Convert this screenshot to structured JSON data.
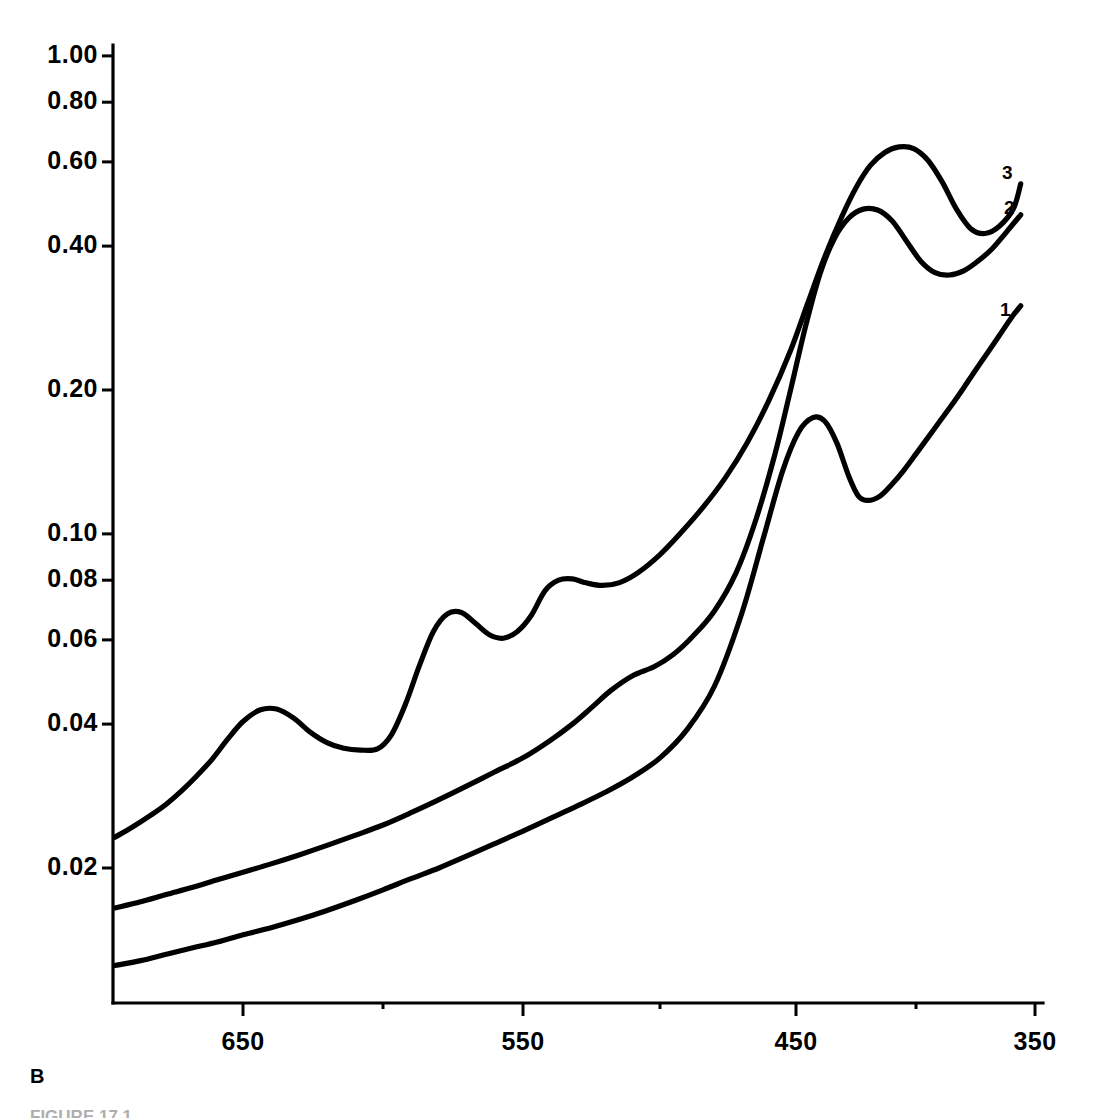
{
  "panel": {
    "label": "B",
    "caption_partial": "FIGURE 17.1"
  },
  "chart_data": {
    "type": "line",
    "title": "",
    "subtitle": "",
    "xlabel": "",
    "ylabel": "",
    "xlim": [
      700,
      350
    ],
    "ylim": [
      0.009,
      1.0
    ],
    "yscale": "log",
    "xscale": "linear",
    "x_reversed": true,
    "grid": false,
    "legend_position": "inline-right-end",
    "xticks": [
      650,
      550,
      450,
      350
    ],
    "xtick_labels": [
      "650",
      "550",
      "450",
      "350"
    ],
    "xminorticks": [
      600,
      500,
      400
    ],
    "yticks": [
      1.0,
      0.8,
      0.6,
      0.4,
      0.2,
      0.1,
      0.08,
      0.06,
      0.04,
      0.02
    ],
    "ytick_labels": [
      "1.00",
      "0.80",
      "0.60",
      "0.40",
      "0.20",
      "0.10",
      "0.08",
      "0.06",
      "0.04",
      "0.02"
    ],
    "series": [
      {
        "name": "1",
        "label": "1",
        "color": "#000000",
        "x": [
          700,
          690,
          680,
          670,
          660,
          650,
          640,
          630,
          620,
          610,
          600,
          590,
          580,
          570,
          560,
          550,
          540,
          530,
          520,
          510,
          500,
          490,
          480,
          470,
          462,
          455,
          449,
          443,
          438,
          433,
          428,
          424,
          420,
          415,
          410,
          405,
          400,
          395,
          390,
          385,
          380,
          375,
          370,
          365,
          360,
          356
        ],
        "y": [
          0.0125,
          0.0128,
          0.0132,
          0.0136,
          0.014,
          0.0145,
          0.015,
          0.0156,
          0.0163,
          0.0171,
          0.018,
          0.019,
          0.02,
          0.0212,
          0.0225,
          0.0239,
          0.0254,
          0.027,
          0.0288,
          0.031,
          0.034,
          0.039,
          0.048,
          0.068,
          0.098,
          0.135,
          0.163,
          0.175,
          0.172,
          0.155,
          0.132,
          0.12,
          0.1175,
          0.12,
          0.127,
          0.136,
          0.147,
          0.159,
          0.172,
          0.186,
          0.202,
          0.22,
          0.239,
          0.26,
          0.283,
          0.3
        ]
      },
      {
        "name": "2",
        "label": "2",
        "color": "#000000",
        "x": [
          700,
          690,
          680,
          670,
          660,
          650,
          640,
          630,
          620,
          610,
          600,
          590,
          580,
          570,
          560,
          550,
          540,
          532,
          525,
          518,
          510,
          502,
          495,
          488,
          480,
          472,
          465,
          458,
          452,
          446,
          440,
          434,
          428,
          422,
          416,
          410,
          404,
          398,
          392,
          386,
          380,
          374,
          368,
          362,
          356
        ],
        "y": [
          0.0165,
          0.017,
          0.0176,
          0.0182,
          0.0189,
          0.0196,
          0.0204,
          0.0213,
          0.0223,
          0.0234,
          0.0246,
          0.0261,
          0.0278,
          0.0297,
          0.0318,
          0.034,
          0.037,
          0.04,
          0.0433,
          0.047,
          0.0505,
          0.0528,
          0.056,
          0.061,
          0.069,
          0.083,
          0.106,
          0.145,
          0.2,
          0.272,
          0.35,
          0.415,
          0.458,
          0.478,
          0.476,
          0.452,
          0.41,
          0.372,
          0.352,
          0.348,
          0.355,
          0.372,
          0.395,
          0.428,
          0.465
        ]
      },
      {
        "name": "3",
        "label": "3",
        "color": "#000000",
        "x": [
          700,
          693,
          686,
          680,
          674,
          668,
          662,
          656,
          650,
          644,
          638,
          632,
          626,
          620,
          614,
          608,
          602,
          597,
          592,
          587,
          582,
          577,
          572,
          567,
          562,
          557,
          552,
          547,
          542,
          537,
          532,
          527,
          521,
          515,
          508,
          500,
          492,
          484,
          476,
          468,
          460,
          452,
          445,
          438,
          431,
          425,
          419,
          413,
          407,
          401,
          395,
          389,
          383,
          377,
          371,
          365,
          359,
          356
        ],
        "y": [
          0.0232,
          0.0244,
          0.0258,
          0.0272,
          0.029,
          0.0312,
          0.0338,
          0.0372,
          0.0405,
          0.0428,
          0.043,
          0.0412,
          0.0385,
          0.0366,
          0.0356,
          0.0353,
          0.0355,
          0.038,
          0.044,
          0.053,
          0.0625,
          0.068,
          0.0685,
          0.065,
          0.0615,
          0.0605,
          0.0625,
          0.0675,
          0.076,
          0.08,
          0.0805,
          0.079,
          0.078,
          0.079,
          0.083,
          0.0905,
          0.101,
          0.114,
          0.131,
          0.155,
          0.19,
          0.242,
          0.305,
          0.38,
          0.46,
          0.53,
          0.59,
          0.628,
          0.645,
          0.64,
          0.605,
          0.545,
          0.478,
          0.435,
          0.425,
          0.44,
          0.48,
          0.54
        ]
      }
    ]
  },
  "axes": {
    "y_axis_name": "absorbance-axis",
    "x_axis_name": "wavelength-axis"
  }
}
